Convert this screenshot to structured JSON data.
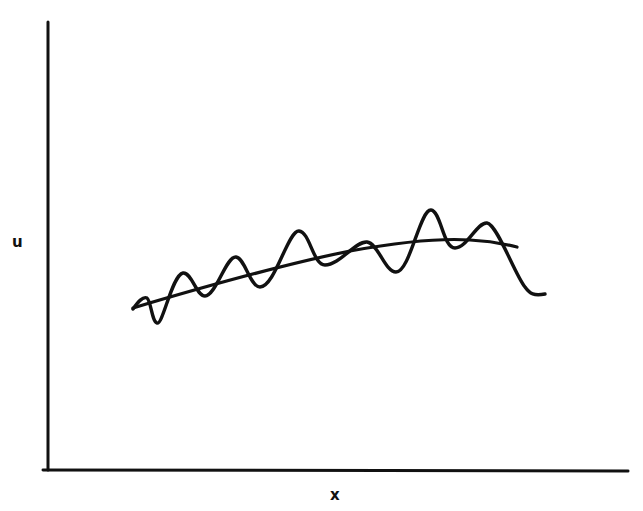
{
  "chart_data": {
    "type": "line",
    "title": "",
    "xlabel": "x",
    "ylabel": "u",
    "grid": false,
    "legend": null,
    "ticks": {
      "x": [],
      "y": []
    },
    "colors": {
      "line": "#111111",
      "axis": "#111111",
      "background": "#ffffff"
    },
    "note": "Qualitative sketch: no numeric axis scales. Coordinates below are in pixel space (origin top-left of image).",
    "axes_px": {
      "y_axis": {
        "x": 48,
        "y_top": 22,
        "y_bottom": 470
      },
      "x_axis": {
        "y": 470,
        "x_left": 43,
        "x_right": 628
      }
    },
    "series": [
      {
        "name": "smooth trend (mean u)",
        "style": "smooth",
        "points_px": [
          [
            133,
            308
          ],
          [
            190,
            292
          ],
          [
            250,
            276
          ],
          [
            300,
            262
          ],
          [
            350,
            251
          ],
          [
            400,
            244
          ],
          [
            430,
            241
          ],
          [
            470,
            241
          ],
          [
            517,
            247
          ]
        ]
      },
      {
        "name": "oscillating u",
        "style": "wavy",
        "points_px": [
          [
            133,
            308
          ],
          [
            145,
            298
          ],
          [
            157,
            323
          ],
          [
            183,
            273
          ],
          [
            205,
            296
          ],
          [
            236,
            257
          ],
          [
            260,
            287
          ],
          [
            299,
            231
          ],
          [
            325,
            265
          ],
          [
            367,
            242
          ],
          [
            396,
            272
          ],
          [
            431,
            210
          ],
          [
            455,
            248
          ],
          [
            487,
            223
          ],
          [
            532,
            296
          ],
          [
            545,
            294
          ]
        ]
      }
    ]
  },
  "labels": {
    "x_axis": "x",
    "y_axis": "u"
  },
  "paths": {
    "y_axis": "M48,22 L48,470",
    "x_axis": "M43,470 L628,471",
    "smooth": "M133,308 C200,288 280,265 350,251 C400,242 440,238 470,240 C490,241 505,244 517,247",
    "wavy": "M133,309 C138,302 143,296 147,298 C151,301 152,322 157,323 C163,325 172,275 183,273 C192,272 196,296 205,296 C216,296 226,256 236,257 C245,258 250,287 260,287 C275,287 288,230 299,231 C310,232 313,265 325,265 C340,265 355,241 367,242 C378,243 385,272 396,272 C410,272 420,209 431,210 C441,211 443,248 455,248 C467,248 477,222 487,223 C497,224 515,275 525,287 C530,294 534,296 545,294"
  }
}
